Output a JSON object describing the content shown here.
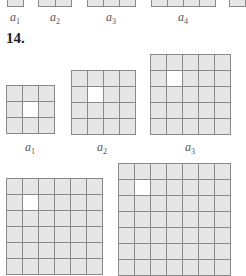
{
  "problem_number": "14.",
  "colors": {
    "cell_fill": "#e6e6e6",
    "hole_fill": "#ffffff",
    "grid_line": "#8a8a8a",
    "text": "#222222"
  },
  "prev_problem_strip": {
    "labels": [
      {
        "var": "a",
        "sub": "1",
        "x": 15
      },
      {
        "var": "a",
        "sub": "2",
        "x": 55
      },
      {
        "var": "a",
        "sub": "3",
        "x": 111
      },
      {
        "var": "a",
        "sub": "4",
        "x": 183
      }
    ]
  },
  "figures": [
    {
      "id": "a1",
      "var": "a",
      "sub": "1",
      "n": 3,
      "hole": [
        1,
        1
      ],
      "x": 6,
      "y": 85,
      "label_x": 30,
      "label_y": 140
    },
    {
      "id": "a2",
      "var": "a",
      "sub": "2",
      "n": 4,
      "hole": [
        1,
        1
      ],
      "x": 71,
      "y": 70,
      "label_x": 102,
      "label_y": 140
    },
    {
      "id": "a3",
      "var": "a",
      "sub": "3",
      "n": 5,
      "hole": [
        1,
        1
      ],
      "x": 150,
      "y": 54,
      "label_x": 190,
      "label_y": 140
    },
    {
      "id": "a4",
      "var": "a",
      "sub": "4",
      "n": 6,
      "hole": [
        1,
        1
      ],
      "x": 6,
      "y": 178
    },
    {
      "id": "a5",
      "var": "a",
      "sub": "5",
      "n": 7,
      "hole": [
        1,
        1
      ],
      "x": 118,
      "y": 163
    }
  ]
}
